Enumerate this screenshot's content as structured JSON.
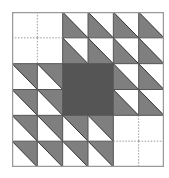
{
  "diagram": {
    "title": "",
    "grid": {
      "rows": 6,
      "cols": 6
    },
    "colors": {
      "light_gray": "#7f7f7f",
      "dark_gray": "#555555",
      "border": "#9a9a9a",
      "grid_line": "#555555",
      "dotted_line": "#9a9a9a",
      "background": "#ffffff"
    },
    "legend": {
      "blank": "empty cell with dotted guide lines",
      "LL": "gray triangle in lower-left half (diagonal TL to BR)",
      "UR": "gray triangle in upper-right half (diagonal TL to BR)",
      "F": "fully shaded dark cell"
    },
    "cells": [
      [
        "blank",
        "blank",
        "LL",
        "LL",
        "LL",
        "LL"
      ],
      [
        "blank",
        "blank",
        "LL",
        "LL",
        "LL",
        "LL"
      ],
      [
        "UR",
        "UR",
        "F",
        "F",
        "LL",
        "LL"
      ],
      [
        "UR",
        "UR",
        "F",
        "F",
        "LL",
        "LL"
      ],
      [
        "UR",
        "UR",
        "UR",
        "UR",
        "blank",
        "blank"
      ],
      [
        "UR",
        "UR",
        "UR",
        "UR",
        "blank",
        "blank"
      ]
    ]
  }
}
